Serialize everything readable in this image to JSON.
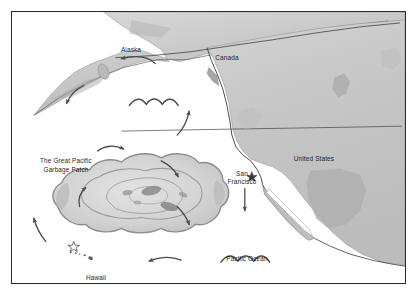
{
  "figure": {
    "type": "illustrated-map",
    "frame_color": "#2b2b2b",
    "ocean_color": "#ffffff",
    "land_color": "#c9c9c9",
    "land_shadow_color": "#9a9a9a",
    "patch_fill_color": "#d6d6d6",
    "patch_outline_color": "#8c8c8c",
    "arrow_color": "#4a4a4a",
    "label_color": "#1d1d1d"
  },
  "labels": {
    "alaska": "Alaska",
    "canada": "Canada",
    "united_states": "United States",
    "san_francisco": "San\nFrancisco",
    "pacific_ocean": "Pacific Ocean",
    "hawaii": "Hawaii",
    "garbage_patch": "The Great Pacific\nGarbage Patch"
  },
  "markers": [
    {
      "name": "honolulu-star",
      "label": "",
      "x": 74,
      "y": 247
    },
    {
      "name": "san-francisco-star",
      "label": "",
      "x": 252,
      "y": 172
    }
  ],
  "current_arrows": [
    {
      "name": "arrow-alaska-westward",
      "direction": "left",
      "x": 131,
      "y": 58
    },
    {
      "name": "arrow-northwest-descending",
      "direction": "down-left",
      "x": 71,
      "y": 96
    },
    {
      "name": "arrow-east-ascending",
      "direction": "up",
      "x": 192,
      "y": 117
    },
    {
      "name": "arrow-patch-north-eastward",
      "direction": "right",
      "x": 112,
      "y": 146
    },
    {
      "name": "arrow-patch-inner-northeast",
      "direction": "down-right",
      "x": 178,
      "y": 172
    },
    {
      "name": "arrow-patch-inner-west",
      "direction": "up",
      "x": 82,
      "y": 190
    },
    {
      "name": "arrow-patch-inner-southeast",
      "direction": "down-right",
      "x": 193,
      "y": 217
    },
    {
      "name": "arrow-southwest-ascending",
      "direction": "up-left",
      "x": 30,
      "y": 226
    },
    {
      "name": "arrow-california-southward",
      "direction": "down",
      "x": 245,
      "y": 200
    },
    {
      "name": "arrow-south-westward",
      "direction": "left",
      "x": 157,
      "y": 268
    }
  ],
  "wave_symbols": [
    {
      "name": "wave-symbol-north",
      "x": 144,
      "y": 104
    },
    {
      "name": "wave-symbol-pacific-ocean",
      "x": 235,
      "y": 261
    }
  ],
  "island_chain": {
    "name": "hawaiian-islands",
    "islands": [
      {
        "x": 70,
        "y": 253,
        "r": 1.0
      },
      {
        "x": 75,
        "y": 254,
        "r": 0.9
      },
      {
        "x": 79,
        "y": 255,
        "r": 0.8
      },
      {
        "x": 84,
        "y": 256,
        "r": 1.1
      },
      {
        "x": 89,
        "y": 258,
        "r": 1.5
      },
      {
        "x": 95,
        "y": 261,
        "r": 2.4
      }
    ]
  }
}
